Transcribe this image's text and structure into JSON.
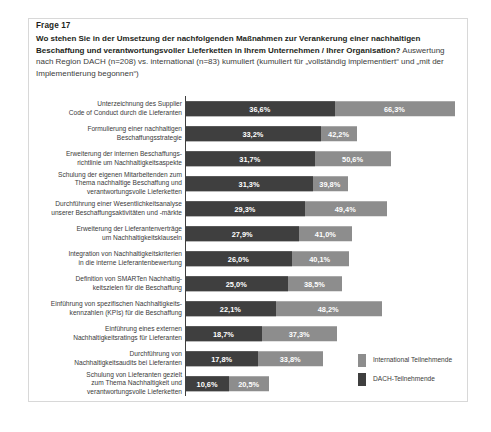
{
  "header": {
    "question_number": "Frage 17",
    "question_bold": "Wo stehen Sie in der Umsetzung der nachfolgenden Maßnahmen zur Verankerung einer nachhaltigen Beschaffung und verantwortungsvoller Lieferketten in Ihrem Unternehmen / Ihrer Organisation?",
    "question_light": " Auswertung nach Region DACH (n=208) vs. international (n=83) kumuliert (kumuliert für „vollständig implementiert“ und „mit der Implementierung begonnen“)"
  },
  "legend": {
    "items": [
      {
        "label": "International Teilnehmende",
        "color": "#8d8d8d"
      },
      {
        "label": "DACH-Teilnehmende",
        "color": "#3f3f3f"
      }
    ]
  },
  "colors": {
    "international": "#8d8d8d",
    "dach": "#3f3f3f",
    "axis": "#3f3f3f",
    "frame": "#d8d8d8"
  },
  "chart_data": {
    "type": "bar",
    "title": "Frage 17",
    "xlabel": "",
    "ylabel": "",
    "orientation": "horizontal",
    "grid": false,
    "legend_position": "right-bottom",
    "xlim": [
      0,
      70
    ],
    "value_suffix": "%",
    "decimal_separator": ",",
    "categories": [
      "Unterzeichnung des Supplier Code of Conduct durch die Lieferanten",
      "Formulierung einer nachhaltigen Beschaffungsstrategie",
      "Erweiterung der internen Beschaffungs-richtlinie um Nachhaltigkeitsaspekte",
      "Schulung der eigenen Mitarbeitenden zum Thema nachhaltige Beschaffung und verantwortungsvolle Lieferketten",
      "Durchführung einer Wesentlichkeitsanalyse unserer Beschaffungsaktivitäten und -märkte",
      "Erweiterung der Lieferantenverträge um Nachhaltigkeitsklauseln",
      "Integration von Nachhaltigkeitskriterien in die interne Lieferantenbewertung",
      "Definition von SMARTen Nachhaltig-keitszielen für die Beschaffung",
      "Einführung von spezifischen Nachhaltigkeits-kennzahlen (KPIs) für die Beschaffung",
      "Einführung eines externen Nachhaltigkeitsratings für Lieferanten",
      "Durchführung von Nachhaltigkeitsaudits bei Lieferanten",
      "Schulung von Lieferanten gezielt zum Thema Nachhaltigkeit und verantwortungsvolle Lieferketten"
    ],
    "category_lines": [
      [
        "Unterzeichnung des Supplier",
        "Code of Conduct durch die Lieferanten"
      ],
      [
        "Formulierung einer nachhaltigen",
        "Beschaffungsstrategie"
      ],
      [
        "Erweiterung der internen Beschaffungs-",
        "richtlinie um Nachhaltigkeitsaspekte"
      ],
      [
        "Schulung der eigenen Mitarbeitenden zum",
        "Thema nachhaltige Beschaffung und",
        "verantwortungsvolle Lieferketten"
      ],
      [
        "Durchführung einer Wesentlichkeitsanalyse",
        "unserer Beschaffungsaktivitäten und -märkte"
      ],
      [
        "Erweiterung der Lieferantenverträge",
        "um Nachhaltigkeitsklauseln"
      ],
      [
        "Integration von Nachhaltigkeitskriterien",
        "in die interne Lieferantenbewertung"
      ],
      [
        "Definition von SMARTen Nachhaltig-",
        "keitszielen für die Beschaffung"
      ],
      [
        "Einführung von spezifischen Nachhaltigkeits-",
        "kennzahlen (KPIs) für die Beschaffung"
      ],
      [
        "Einführung eines externen",
        "Nachhaltigkeitsratings für Lieferanten"
      ],
      [
        "Durchführung von",
        "Nachhaltigkeitsaudits bei Lieferanten"
      ],
      [
        "Schulung von Lieferanten gezielt",
        "zum Thema Nachhaltigkeit und",
        "verantwortungsvolle Lieferketten"
      ]
    ],
    "series": [
      {
        "name": "DACH-Teilnehmende",
        "color": "#3f3f3f",
        "values": [
          36.6,
          33.2,
          31.7,
          31.3,
          29.3,
          27.9,
          26.0,
          25.0,
          22.1,
          18.7,
          17.8,
          10.6
        ],
        "labels": [
          "36,6%",
          "33,2%",
          "31,7%",
          "31,3%",
          "29,3%",
          "27,9%",
          "26,0%",
          "25,0%",
          "22,1%",
          "18,7%",
          "17,8%",
          "10,6%"
        ]
      },
      {
        "name": "International Teilnehmende",
        "color": "#8d8d8d",
        "values": [
          66.3,
          42.2,
          50.6,
          39.8,
          49.4,
          41.0,
          40.1,
          38.5,
          48.2,
          37.3,
          33.8,
          20.5
        ],
        "labels": [
          "66,3%",
          "42,2%",
          "50,6%",
          "39,8%",
          "49,4%",
          "41,0%",
          "40,1%",
          "38,5%",
          "48,2%",
          "37,3%",
          "33,8%",
          "20,5%"
        ]
      }
    ]
  }
}
